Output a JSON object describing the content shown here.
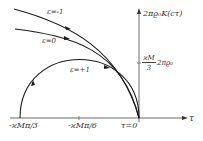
{
  "figure": {
    "y_axis_label": "2πϱ₀K(cτ)",
    "x_axis_label": "τ",
    "y_tick": {
      "numerator": "ϰM",
      "denominator": "3",
      "factor": "2πϱ₀"
    },
    "x_ticks": [
      "-ϰMπ/3",
      "-ϰMπ/6",
      "τ=0"
    ],
    "curves": [
      {
        "label": "ε=-1",
        "color": "#1a1a1a"
      },
      {
        "label": "ε=0",
        "color": "#1a1a1a"
      },
      {
        "label": "ε=+1",
        "color": "#1a1a1a"
      }
    ]
  }
}
